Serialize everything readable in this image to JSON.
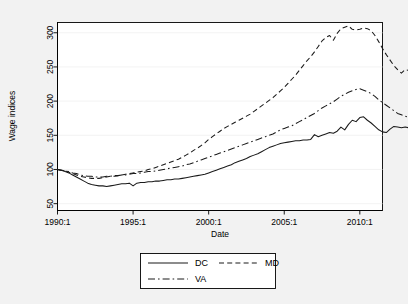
{
  "chart_data": {
    "type": "line",
    "title": "",
    "xlabel": "Date",
    "ylabel": "Wage indices",
    "xlim": [
      1990.0,
      2011.5
    ],
    "ylim": [
      40,
      315
    ],
    "yticks": [
      50,
      100,
      150,
      200,
      250,
      300
    ],
    "ytick_labels": [
      "50",
      "100",
      "150",
      "200",
      "250",
      "300"
    ],
    "xticks": [
      1990,
      1995,
      2000,
      2005,
      2010
    ],
    "xtick_labels": [
      "1990:1",
      "1995:1",
      "2000:1",
      "2005:1",
      "2010:1"
    ],
    "grid": "horizontal",
    "legend_position": "below-center",
    "x_start": 1990.0,
    "x_step": 0.25,
    "series": [
      {
        "name": "DC",
        "style": "solid",
        "values": [
          100,
          99,
          97,
          95,
          92,
          89,
          86,
          83,
          80,
          78,
          77,
          76,
          76,
          75,
          76,
          77,
          78,
          79,
          79,
          80,
          76,
          80,
          81,
          81,
          82,
          82,
          83,
          83,
          84,
          85,
          85,
          86,
          86,
          87,
          88,
          89,
          90,
          91,
          92,
          93,
          95,
          97,
          99,
          101,
          103,
          105,
          107,
          110,
          112,
          114,
          116,
          119,
          121,
          123,
          126,
          129,
          132,
          134,
          136,
          138,
          139,
          140,
          141,
          142,
          142,
          143,
          143,
          144,
          151,
          148,
          150,
          152,
          154,
          153,
          156,
          162,
          158,
          166,
          172,
          170,
          176,
          177,
          172,
          168,
          163,
          158,
          155,
          154,
          159,
          163,
          162,
          161,
          162,
          161
        ]
      },
      {
        "name": "MD",
        "style": "dashed",
        "values": [
          100,
          99,
          98,
          96,
          94,
          92,
          90,
          89,
          88,
          87,
          87,
          87,
          88,
          89,
          90,
          90,
          91,
          92,
          93,
          94,
          95,
          96,
          97,
          98,
          100,
          101,
          103,
          105,
          107,
          109,
          111,
          113,
          115,
          118,
          121,
          124,
          128,
          131,
          135,
          139,
          144,
          148,
          152,
          156,
          160,
          163,
          166,
          169,
          172,
          175,
          178,
          181,
          185,
          189,
          193,
          197,
          201,
          205,
          210,
          215,
          220,
          226,
          232,
          238,
          245,
          252,
          259,
          265,
          272,
          280,
          288,
          293,
          296,
          289,
          299,
          306,
          308,
          310,
          305,
          304,
          305,
          307,
          306,
          303,
          296,
          287,
          277,
          268,
          260,
          252,
          246,
          241,
          246,
          245
        ]
      },
      {
        "name": "VA",
        "style": "dash-dot",
        "values": [
          100,
          99,
          98,
          97,
          95,
          94,
          92,
          91,
          90,
          90,
          89,
          89,
          89,
          90,
          90,
          91,
          91,
          92,
          92,
          93,
          94,
          94,
          95,
          96,
          97,
          97,
          98,
          99,
          100,
          101,
          102,
          103,
          104,
          105,
          107,
          108,
          110,
          112,
          114,
          116,
          118,
          120,
          122,
          124,
          126,
          128,
          130,
          132,
          134,
          136,
          138,
          140,
          142,
          144,
          146,
          148,
          150,
          152,
          155,
          158,
          160,
          162,
          164,
          167,
          170,
          173,
          176,
          179,
          182,
          186,
          190,
          193,
          196,
          199,
          203,
          207,
          210,
          213,
          215,
          217,
          218,
          216,
          214,
          211,
          207,
          202,
          198,
          194,
          190,
          186,
          182,
          180,
          178,
          176
        ]
      }
    ]
  },
  "legend": {
    "entries": [
      {
        "label": "DC",
        "style": "solid"
      },
      {
        "label": "MD",
        "style": "dashed"
      },
      {
        "label": "VA",
        "style": "dash-dot"
      }
    ]
  },
  "colors": {
    "background": "#f2f2f2",
    "plot_background": "#ffffff",
    "line": "#1a1a1a",
    "grid": "#f0f0f0",
    "axis": "#000000"
  }
}
